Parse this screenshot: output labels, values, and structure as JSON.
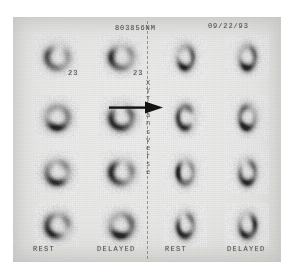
{
  "film": {
    "study_id": "803856NM",
    "study_date": "09/22/93",
    "orientation_label": "X Y Transverse",
    "orientation_chars": [
      "X",
      "Y",
      "T",
      "r",
      "a",
      "n",
      "s",
      "v",
      "e",
      "r",
      "s",
      "e"
    ],
    "slice_numbers": [
      "23",
      "23"
    ],
    "panel_labels": [
      "REST",
      "DELAYED",
      "REST",
      "DELAYED"
    ],
    "divider": {
      "style": "dashed",
      "color": "#7d7d7d"
    },
    "arrow": {
      "direction": "right",
      "color": "#111111"
    },
    "background_color": "#e8e8e6",
    "ink_color": "#4a4a4a"
  },
  "chart_data": {
    "type": "heatmap",
    "title": "803856NM",
    "subtitle": "09/22/93",
    "xlabel": "",
    "ylabel": "X Y Transverse",
    "grid": {
      "rows": 4,
      "cols": 4
    },
    "categories": [
      "REST",
      "DELAYED",
      "REST",
      "DELAYED"
    ],
    "row_labels": [
      "23",
      "",
      "",
      ""
    ],
    "colormap": "grayscale-inverted",
    "series": [
      {
        "name": "REST (left panel)",
        "column": 0,
        "values": [
          0.62,
          0.78,
          0.74,
          0.8
        ],
        "slice_shape": "ring",
        "aspect": 1.0
      },
      {
        "name": "DELAYED (left panel)",
        "column": 1,
        "values": [
          0.7,
          0.86,
          0.78,
          0.84
        ],
        "slice_shape": "ring",
        "aspect": 1.0
      },
      {
        "name": "REST (right panel)",
        "column": 2,
        "values": [
          0.8,
          0.84,
          0.8,
          0.86
        ],
        "slice_shape": "ring-elongated",
        "aspect": 0.72
      },
      {
        "name": "DELAYED (right panel)",
        "column": 3,
        "values": [
          0.82,
          0.86,
          0.82,
          0.88
        ],
        "slice_shape": "ring-elongated",
        "aspect": 0.72
      }
    ],
    "annotations": [
      {
        "type": "arrow",
        "direction": "right",
        "row": 1,
        "between_columns": [
          1,
          2
        ]
      },
      {
        "type": "text",
        "text": "23",
        "row": 0,
        "column": 0
      },
      {
        "type": "text",
        "text": "23",
        "row": 0,
        "column": 1
      }
    ]
  }
}
